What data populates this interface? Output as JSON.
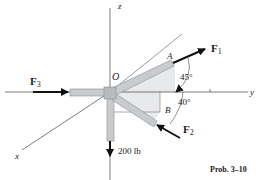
{
  "diagram": {
    "caption": "Prob. 3–10",
    "axes": {
      "x": "x",
      "y": "y",
      "z": "z"
    },
    "points": {
      "origin": "O",
      "A": "A",
      "B": "B"
    },
    "forces": {
      "F1": {
        "label": "F",
        "sub": "1"
      },
      "F2": {
        "label": "F",
        "sub": "2"
      },
      "F3": {
        "label": "F",
        "sub": "3"
      },
      "W": {
        "label": "200 lb"
      }
    },
    "angles": {
      "a1": "45°",
      "a2": "40°"
    },
    "colors": {
      "pipe": "#c9ccce",
      "pipe_edge": "#8a8d90",
      "plane": "#e6e7e8",
      "axis": "#444444",
      "arrow": "#111111"
    }
  }
}
